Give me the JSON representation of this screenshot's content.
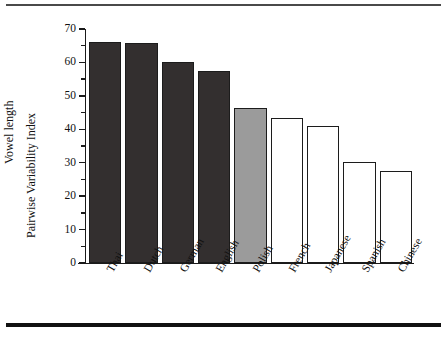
{
  "chart_data": {
    "type": "bar",
    "title": "",
    "subtitle": "",
    "xlabel": "",
    "ylabel": "Vowel length Pairwise Variability Index",
    "ylabel_lines": [
      "Vowel length",
      "Pairwise Variability Index"
    ],
    "categories": [
      "Thai",
      "Dutch",
      "German",
      "English",
      "Polish",
      "French",
      "Japanese",
      "Spanish",
      "Chinese"
    ],
    "values": [
      66.0,
      65.8,
      60.2,
      57.3,
      46.5,
      43.3,
      41.0,
      30.2,
      27.6
    ],
    "bar_styles": [
      "dark",
      "dark",
      "dark",
      "dark",
      "gray",
      "open",
      "open",
      "open",
      "open"
    ],
    "ylim": [
      0,
      70
    ],
    "yticks": [
      0,
      10,
      20,
      30,
      40,
      50,
      60,
      70
    ],
    "ytick_labels": [
      "0",
      "10",
      "20",
      "30",
      "40",
      "50",
      "60",
      "70"
    ],
    "yminor_ticks": [
      5,
      15,
      25,
      35,
      45,
      55,
      65
    ],
    "xlim_categories": 9,
    "grid": false,
    "legend": null,
    "annotations": [],
    "colors": {
      "dark_fill": "#332f2f",
      "gray_fill": "#9b9b9b",
      "open_fill": "#ffffff",
      "bar_edge": "#1c1c1c",
      "axis": "#1a1a1a",
      "text": "#111111",
      "rule_top": "#4a4a4a",
      "rule_bottom": "#111111",
      "background": "#ffffff"
    }
  }
}
